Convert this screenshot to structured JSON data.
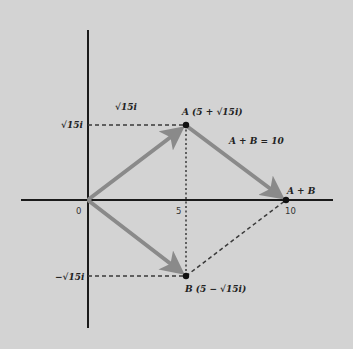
{
  "diagram": {
    "type": "complex-plane vector addition",
    "colors": {
      "background": "#d3d3d3",
      "axis": "#1a1a1a",
      "vector": "#8a8a8a",
      "dashed": "#3a3a3a",
      "point": "#111111"
    },
    "axes": {
      "origin_label": "0",
      "x_tick_5": "5",
      "x_tick_10": "10",
      "y_tick_pos": "√15i",
      "y_tick_neg": "−√15i"
    },
    "labels": {
      "top_magnitude": "√15i",
      "point_a": "A (5 + √15i)",
      "point_b": "B (5 − √15i)",
      "sum_point": "A + B",
      "sum_equation": "A + B = 10"
    },
    "points": {
      "origin": {
        "re": 0,
        "im": 0
      },
      "A": {
        "re": 5,
        "im": "√15"
      },
      "B": {
        "re": 5,
        "im": "−√15"
      },
      "A_plus_B": {
        "re": 10,
        "im": 0
      }
    }
  }
}
